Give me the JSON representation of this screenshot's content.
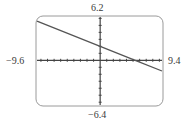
{
  "chart_data": {
    "type": "line",
    "title": "",
    "xlabel": "",
    "ylabel": "",
    "xlim": [
      -9.6,
      9.4
    ],
    "ylim": [
      -6.4,
      6.2
    ],
    "x_tick_step": 1,
    "y_tick_step": 1,
    "grid": false,
    "legend": null,
    "window_labels": {
      "ymax": "6.2",
      "ymin": "−6.4",
      "xmin": "−9.6",
      "xmax": "9.4"
    },
    "series": [
      {
        "name": "line",
        "equation_estimate": "y = -0.375x + 2",
        "x": [
          -9.6,
          0,
          5.33,
          9.4
        ],
        "y": [
          5.6,
          2.0,
          0.0,
          -1.53
        ]
      }
    ]
  },
  "colors": {
    "frame": "#9a9a9a",
    "axes": "#444444",
    "line": "#555555"
  }
}
